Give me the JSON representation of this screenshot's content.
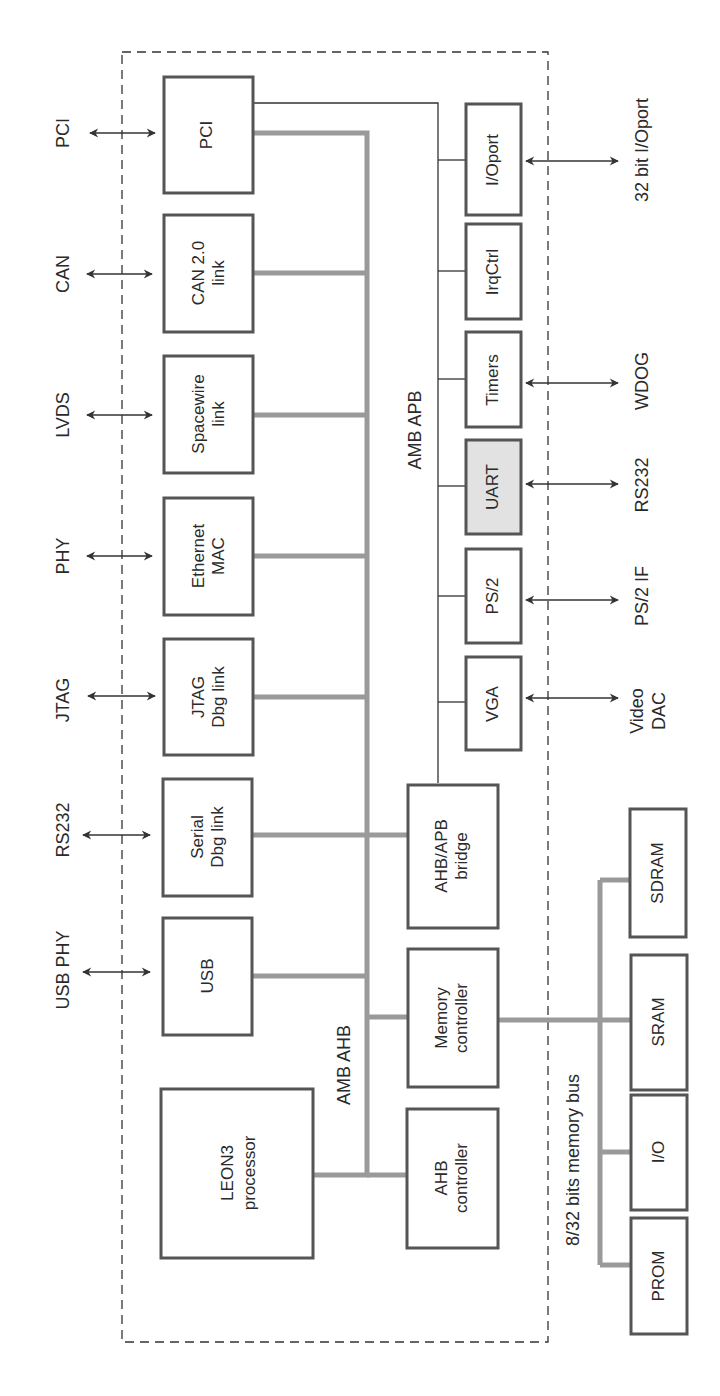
{
  "diagram": {
    "orientation": "rotated-90-ccw",
    "bus_labels": {
      "ahb": "AMB AHB",
      "apb": "AMB APB",
      "memory_bus": "8/32 bits memory bus"
    },
    "ahb_masters_and_slaves": [
      {
        "id": "pci",
        "line1": "PCI",
        "line2": "",
        "external": "PCI"
      },
      {
        "id": "can",
        "line1": "CAN 2.0",
        "line2": "link",
        "external": "CAN"
      },
      {
        "id": "spacewire",
        "line1": "Spacewire",
        "line2": "link",
        "external": "LVDS"
      },
      {
        "id": "ethernet",
        "line1": "Ethernet",
        "line2": "MAC",
        "external": "PHY"
      },
      {
        "id": "jtag",
        "line1": "JTAG",
        "line2": "Dbg link",
        "external": "JTAG"
      },
      {
        "id": "serial",
        "line1": "Serial",
        "line2": "Dbg link",
        "external": "RS232"
      },
      {
        "id": "usb",
        "line1": "USB",
        "line2": "",
        "external": "USB PHY"
      }
    ],
    "processor": {
      "line1": "LEON3",
      "line2": "processor"
    },
    "core_blocks": [
      {
        "id": "bridge",
        "line1": "AHB/APB",
        "line2": "bridge"
      },
      {
        "id": "memctrl",
        "line1": "Memory",
        "line2": "controller"
      },
      {
        "id": "ahbctrl",
        "line1": "AHB",
        "line2": "controller"
      }
    ],
    "apb_peripherals": [
      {
        "id": "ioport",
        "label": "I/Oport",
        "external_line1": "32 bit I/Oport",
        "external_line2": "",
        "shaded": false
      },
      {
        "id": "irqctrl",
        "label": "IrqCtrl",
        "external_line1": "",
        "external_line2": "",
        "shaded": false
      },
      {
        "id": "timers",
        "label": "Timers",
        "external_line1": "WDOG",
        "external_line2": "",
        "shaded": false
      },
      {
        "id": "uart",
        "label": "UART",
        "external_line1": "RS232",
        "external_line2": "",
        "shaded": true
      },
      {
        "id": "ps2",
        "label": "PS/2",
        "external_line1": "PS/2 IF",
        "external_line2": "",
        "shaded": false
      },
      {
        "id": "vga",
        "label": "VGA",
        "external_line1": "Video",
        "external_line2": "DAC",
        "shaded": false
      }
    ],
    "memory_devices": [
      {
        "id": "sdram",
        "label": "SDRAM"
      },
      {
        "id": "sram",
        "label": "SRAM"
      },
      {
        "id": "io",
        "label": "I/O"
      },
      {
        "id": "prom",
        "label": "PROM"
      }
    ]
  }
}
